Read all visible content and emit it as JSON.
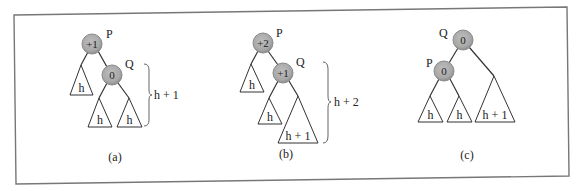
{
  "figure": {
    "type": "AVL tree rotation illustration",
    "panels": [
      {
        "id": "a",
        "caption": "(a)",
        "nodes": [
          {
            "name": "P",
            "balance": "+1"
          },
          {
            "name": "Q",
            "balance": "0"
          }
        ],
        "subtrees": [
          "h",
          "h",
          "h"
        ],
        "height_label": "h + 1"
      },
      {
        "id": "b",
        "caption": "(b)",
        "nodes": [
          {
            "name": "P",
            "balance": "+2"
          },
          {
            "name": "Q",
            "balance": "+1"
          }
        ],
        "subtrees": [
          "h",
          "h",
          "h + 1"
        ],
        "height_label": "h + 2"
      },
      {
        "id": "c",
        "caption": "(c)",
        "nodes": [
          {
            "name": "Q",
            "balance": "0"
          },
          {
            "name": "P",
            "balance": "0"
          }
        ],
        "subtrees": [
          "h",
          "h",
          "h + 1"
        ]
      }
    ]
  },
  "colors": {
    "node_fill": "#a8a8a8",
    "node_rim": "#8a8a8a",
    "frame": "#777777"
  }
}
